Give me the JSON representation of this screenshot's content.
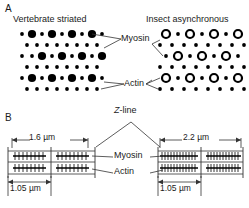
{
  "figure": {
    "panels": [
      {
        "id": "A",
        "letter": "A",
        "title_left": "Vertebrate striated",
        "title_right": "Insect asynchronous",
        "labels": [
          {
            "name": "myosin",
            "text": "Myosin"
          },
          {
            "name": "actin",
            "text": "Actin"
          }
        ],
        "left_lattice": {
          "myosin_style": "filled-circle",
          "actin_style": "small-filled-dot",
          "myosin_rows": 4,
          "myosin_per_row": 4,
          "actin_ratio_note": "2:1 actin:myosin hexagonal lattice"
        },
        "right_lattice": {
          "myosin_style": "open-ring",
          "actin_style": "small-filled-dot",
          "myosin_rows": 4,
          "myosin_per_row": 4,
          "actin_ratio_note": "3:1 actin:myosin lattice"
        }
      },
      {
        "id": "B",
        "letter": "B",
        "zline_label": "Z-line",
        "labels": [
          {
            "name": "myosin",
            "text": "Myosin"
          },
          {
            "name": "actin",
            "text": "Actin"
          }
        ],
        "sarcomeres": [
          {
            "name": "vertebrate-sarcomere",
            "sarcomere_length": "1.6 µm",
            "thick_filament_length": "1.05 µm"
          },
          {
            "name": "insect-sarcomere",
            "sarcomere_length": "2.2 µm",
            "thick_filament_length": "1.05 µm"
          }
        ]
      }
    ]
  },
  "colors": {
    "ink": "#1a1a1a",
    "line": "#4d4d4d",
    "fill": "#000000",
    "background": "#ffffff"
  }
}
